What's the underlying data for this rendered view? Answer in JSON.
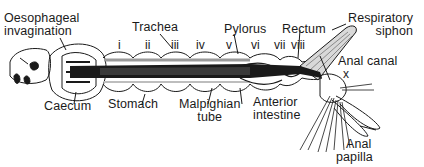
{
  "diagram": {
    "labels": {
      "oesophageal_invagination": [
        "Oesophageal",
        "invagination"
      ],
      "trachea": "Trachea",
      "pylorus": "Pylorus",
      "rectum": "Rectum",
      "respiratory_siphon": [
        "Respiratory",
        "siphon"
      ],
      "anal_canal": "Anal canal",
      "caecum": "Caecum",
      "stomach": "Stomach",
      "malpighian_tube": [
        "Malpighian",
        "tube"
      ],
      "anterior_intestine": [
        "Anterior",
        "intestine"
      ],
      "anal_papilla": [
        "Anal",
        "papilla"
      ]
    },
    "segments": [
      "i",
      "ii",
      "iii",
      "iv",
      "v",
      "vi",
      "vii",
      "viii",
      "x"
    ],
    "colors": {
      "ink": "#1a1a1a",
      "background": "#ffffff",
      "shade": "#8a8a8a"
    }
  }
}
